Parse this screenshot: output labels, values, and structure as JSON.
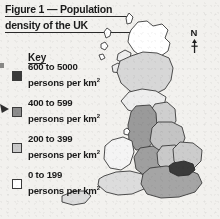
{
  "figure": {
    "title_line1": "Figure 1 — Population",
    "title_line2": "density of the UK"
  },
  "key": {
    "heading": "Key",
    "items": [
      {
        "range": "600 to 5000",
        "unit": "persons per km",
        "exponent": "2",
        "color": "#3a3a3a",
        "swatch_name": "key-swatch-600-5000"
      },
      {
        "range": "400 to 599",
        "unit": "persons per km",
        "exponent": "2",
        "color": "#8c8c8c",
        "swatch_name": "key-swatch-400-599"
      },
      {
        "range": "200 to 399",
        "unit": "persons per km",
        "exponent": "2",
        "color": "#c9c9c9",
        "swatch_name": "key-swatch-200-399"
      },
      {
        "range": "0 to 199",
        "unit": "persons per km",
        "exponent": "2",
        "color": "#ffffff",
        "swatch_name": "key-swatch-0-199"
      }
    ]
  },
  "compass": {
    "label": "N",
    "icon": "north-arrow-icon"
  },
  "map": {
    "name": "uk-population-density-map",
    "outline_color": "#3b3b3b",
    "background": "#f2f1ee",
    "regions": [
      {
        "name": "northern-scotland",
        "band": "0 to 199",
        "fill": "#ffffff"
      },
      {
        "name": "central-scotland",
        "band": "200 to 399",
        "fill": "#d7d7d7"
      },
      {
        "name": "southern-scotland",
        "band": "0 to 199",
        "fill": "#ededed"
      },
      {
        "name": "north-east-england",
        "band": "200 to 399",
        "fill": "#cfcfcf"
      },
      {
        "name": "north-west-england",
        "band": "400 to 599",
        "fill": "#9a9a9a"
      },
      {
        "name": "yorkshire-humber",
        "band": "200 to 399",
        "fill": "#c4c4c4"
      },
      {
        "name": "west-midlands",
        "band": "400 to 599",
        "fill": "#9f9f9f"
      },
      {
        "name": "east-midlands",
        "band": "200 to 399",
        "fill": "#c9c9c9"
      },
      {
        "name": "east-of-england",
        "band": "200 to 399",
        "fill": "#cccccc"
      },
      {
        "name": "wales",
        "band": "0 to 199",
        "fill": "#f4f4f4"
      },
      {
        "name": "south-west-england",
        "band": "0 to 199",
        "fill": "#dcdcdc"
      },
      {
        "name": "south-east-england",
        "band": "400 to 599",
        "fill": "#a5a5a5"
      },
      {
        "name": "greater-london",
        "band": "600 to 5000",
        "fill": "#3a3a3a"
      }
    ]
  }
}
